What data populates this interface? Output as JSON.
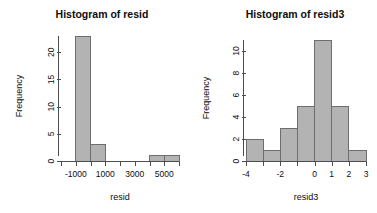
{
  "figure": {
    "background_color": "#ffffff",
    "bar_fill_color": "#b3b3b3",
    "bar_border_color": "#6e6e6e",
    "axis_color": "#4d4d4d",
    "text_color": "#0d0d0d"
  },
  "chart_data": [
    {
      "type": "bar",
      "id": "histogram-resid",
      "title": "Histogram of resid",
      "xlabel": "resid",
      "ylabel": "Frequency",
      "xlim": [
        -2000,
        6000
      ],
      "ylim": [
        0,
        23
      ],
      "grid": false,
      "legend": null,
      "bin_width": 1000,
      "bin_edges": [
        -2000,
        -1000,
        0,
        1000,
        2000,
        3000,
        4000,
        5000,
        6000
      ],
      "values": [
        0,
        23,
        3,
        0,
        0,
        0,
        1,
        1
      ],
      "categories": [
        "-2000 to -1000",
        "-1000 to 0",
        "0 to 1000",
        "1000 to 2000",
        "2000 to 3000",
        "3000 to 4000",
        "4000 to 5000",
        "5000 to 6000"
      ],
      "xticks": [
        -2000,
        -1000,
        0,
        1000,
        2000,
        3000,
        4000,
        5000,
        6000
      ],
      "xticklabels": [
        "",
        "-1000",
        "",
        "1000",
        "",
        "3000",
        "",
        "5000",
        ""
      ],
      "yticks": [
        0,
        5,
        10,
        15,
        20
      ],
      "yticklabels": [
        "0",
        "5",
        "10",
        "15",
        "20"
      ]
    },
    {
      "type": "bar",
      "id": "histogram-resid3",
      "title": "Histogram of resid3",
      "xlabel": "resid3",
      "ylabel": "Frequency",
      "xlim": [
        -4,
        3
      ],
      "ylim": [
        0,
        11
      ],
      "grid": false,
      "legend": null,
      "bin_width": 1,
      "bin_edges": [
        -4,
        -3,
        -2,
        -1,
        0,
        1,
        2,
        3
      ],
      "values": [
        2,
        1,
        3,
        5,
        11,
        5,
        1
      ],
      "categories": [
        "-4 to -3",
        "-3 to -2",
        "-2 to -1",
        "-1 to 0",
        "0 to 1",
        "1 to 2",
        "2 to 3"
      ],
      "xticks": [
        -4,
        -3,
        -2,
        -1,
        0,
        1,
        2,
        3
      ],
      "xticklabels": [
        "-4",
        "",
        "-2",
        "",
        "0",
        "1",
        "2",
        "3"
      ],
      "yticks": [
        0,
        2,
        4,
        6,
        8,
        10
      ],
      "yticklabels": [
        "0",
        "2",
        "4",
        "6",
        "8",
        "10"
      ]
    }
  ]
}
